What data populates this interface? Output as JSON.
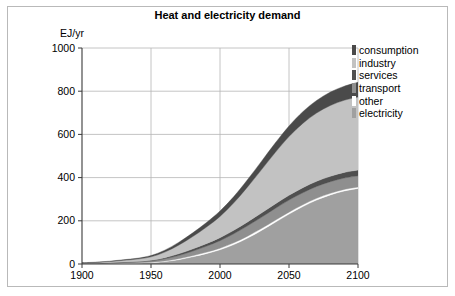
{
  "figure": {
    "title": "Heat and electricity demand",
    "ylabel": "EJ/yr"
  },
  "legend": {
    "items": [
      {
        "label": "consumption",
        "color": "#4a4a4a"
      },
      {
        "label": "industry",
        "color": "#c2c2c2"
      },
      {
        "label": "services",
        "color": "#4f4f4f"
      },
      {
        "label": "transport",
        "color": "#8f8f8f"
      },
      {
        "label": "other",
        "color": "#ffffff"
      },
      {
        "label": "electricity",
        "color": "#a0a0a0"
      }
    ]
  },
  "chart_data": {
    "type": "area",
    "title": "Heat and electricity demand",
    "xlabel": "",
    "ylabel": "EJ/yr",
    "xlim": [
      1900,
      2100
    ],
    "ylim": [
      0,
      1000
    ],
    "xticks": [
      1900,
      1950,
      2000,
      2050,
      2100
    ],
    "yticks": [
      0,
      200,
      400,
      600,
      800,
      1000
    ],
    "grid": true,
    "legend_position": "right-outside",
    "stacked": true,
    "x": [
      1900,
      1910,
      1920,
      1930,
      1940,
      1950,
      1960,
      1970,
      1980,
      1990,
      2000,
      2010,
      2020,
      2030,
      2040,
      2050,
      2060,
      2070,
      2080,
      2090,
      2100
    ],
    "series": [
      {
        "name": "electricity",
        "color": "#a0a0a0",
        "values": [
          1,
          1,
          2,
          3,
          4,
          6,
          11,
          20,
          33,
          48,
          66,
          90,
          120,
          155,
          193,
          231,
          266,
          296,
          320,
          338,
          350
        ]
      },
      {
        "name": "other",
        "color": "#ffffff",
        "values": [
          0.5,
          0.7,
          1,
          1.3,
          1.6,
          2,
          3,
          4,
          5,
          6,
          7,
          8,
          9,
          9,
          9,
          9,
          8,
          8,
          7,
          7,
          6
        ]
      },
      {
        "name": "transport",
        "color": "#8f8f8f",
        "values": [
          1,
          1.5,
          2,
          3,
          4,
          6,
          10,
          15,
          21,
          28,
          35,
          42,
          48,
          52,
          55,
          56,
          56,
          55,
          54,
          53,
          52
        ]
      },
      {
        "name": "services",
        "color": "#4f4f4f",
        "values": [
          0.5,
          0.8,
          1,
          1.5,
          2,
          3,
          5,
          8,
          10,
          12,
          14,
          16,
          18,
          20,
          21,
          22,
          23,
          24,
          25,
          26,
          27
        ]
      },
      {
        "name": "industry",
        "color": "#c2c2c2",
        "values": [
          2,
          3,
          5,
          8,
          11,
          16,
          26,
          40,
          57,
          76,
          98,
          127,
          162,
          200,
          238,
          272,
          298,
          316,
          328,
          334,
          338
        ]
      },
      {
        "name": "consumption",
        "color": "#4a4a4a",
        "values": [
          1,
          1.5,
          2,
          3,
          4,
          6,
          9,
          13,
          17,
          21,
          25,
          29,
          34,
          39,
          44,
          49,
          54,
          58,
          62,
          65,
          68
        ]
      }
    ],
    "totals_at_2100": 841
  },
  "colors": {
    "plot_background": "#ffffff",
    "grid": "#b5b5b5",
    "axis": "#3a3a3a",
    "frame": "#b9b9b9",
    "text": "#000000"
  }
}
